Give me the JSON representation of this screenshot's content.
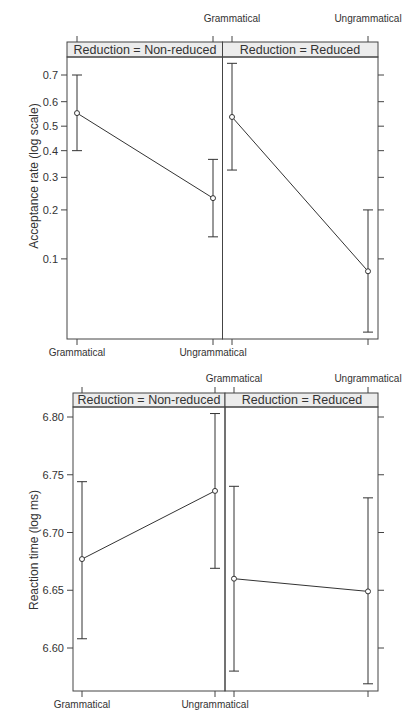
{
  "chart_data": [
    {
      "type": "line",
      "ylabel": "Acceptance rate (log scale)",
      "xlabel": "",
      "y_scale": "logit",
      "ylim": [
        0.032,
        0.75
      ],
      "yticks": [
        0.1,
        0.2,
        0.3,
        0.4,
        0.5,
        0.6,
        0.7
      ],
      "ytick_labels": [
        "0.1",
        "0.2",
        "0.3",
        "0.4",
        "0.5",
        "0.6",
        "0.7"
      ],
      "categories": [
        "Grammatical",
        "Ungrammatical"
      ],
      "grid": false,
      "panels": [
        {
          "strip": "Reduction = Non-reduced",
          "values": [
            0.554,
            0.233
          ],
          "upper": [
            0.7,
            0.366
          ],
          "lower": [
            0.4,
            0.138
          ]
        },
        {
          "strip": "Reduction = Reduced",
          "values": [
            0.538,
            0.083
          ],
          "upper": [
            0.739,
            0.2
          ],
          "lower": [
            0.326,
            0.032
          ]
        }
      ]
    },
    {
      "type": "line",
      "ylabel": "Reaction time (log ms)",
      "xlabel": "",
      "y_scale": "linear",
      "ylim": [
        6.563,
        6.808
      ],
      "yticks": [
        6.6,
        6.65,
        6.7,
        6.75,
        6.8
      ],
      "ytick_labels": [
        "6.60",
        "6.65",
        "6.70",
        "6.75",
        "6.80"
      ],
      "categories": [
        "Grammatical",
        "Ungrammatical"
      ],
      "grid": false,
      "panels": [
        {
          "strip": "Reduction = Non-reduced",
          "values": [
            6.677,
            6.736
          ],
          "upper": [
            6.744,
            6.803
          ],
          "lower": [
            6.608,
            6.669
          ]
        },
        {
          "strip": "Reduction = Reduced",
          "values": [
            6.66,
            6.649
          ],
          "upper": [
            6.74,
            6.73
          ],
          "lower": [
            6.58,
            6.569
          ]
        }
      ]
    }
  ],
  "colors": {
    "line": "#333333",
    "frame": "#444444",
    "strip_fill": "#ececec",
    "text": "#333333"
  }
}
